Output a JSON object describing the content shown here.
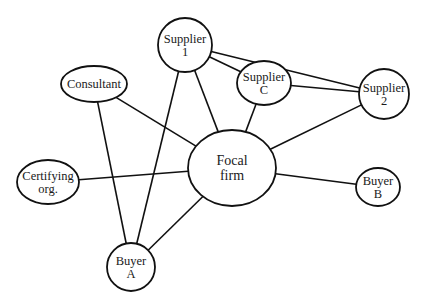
{
  "diagram": {
    "type": "network",
    "nodes": [
      {
        "id": "supplier1",
        "line1": "Supplier",
        "line2": "1",
        "shape": "circle",
        "cx": 185,
        "cy": 45,
        "rx": 27,
        "ry": 27
      },
      {
        "id": "consultant",
        "line1": "Consultant",
        "line2": "",
        "shape": "ellipse",
        "cx": 94,
        "cy": 84,
        "rx": 33,
        "ry": 18
      },
      {
        "id": "supplierC",
        "line1": "Supplier",
        "line2": "C",
        "shape": "ellipse",
        "cx": 264,
        "cy": 83,
        "rx": 27,
        "ry": 22
      },
      {
        "id": "supplier2",
        "line1": "Supplier",
        "line2": "2",
        "shape": "circle",
        "cx": 384,
        "cy": 94,
        "rx": 25,
        "ry": 25
      },
      {
        "id": "focal",
        "line1": "Focal",
        "line2": "firm",
        "shape": "ellipse",
        "cx": 232,
        "cy": 168,
        "rx": 44,
        "ry": 38
      },
      {
        "id": "certifying",
        "line1": "Certifying",
        "line2": "org.",
        "shape": "ellipse",
        "cx": 48,
        "cy": 182,
        "rx": 31,
        "ry": 22
      },
      {
        "id": "buyerB",
        "line1": "Buyer",
        "line2": "B",
        "shape": "ellipse",
        "cx": 378,
        "cy": 187,
        "rx": 22,
        "ry": 19
      },
      {
        "id": "buyerA",
        "line1": "Buyer",
        "line2": "A",
        "shape": "circle",
        "cx": 131,
        "cy": 267,
        "rx": 24,
        "ry": 24
      }
    ],
    "edges": [
      {
        "from": "supplier1",
        "to": "supplier2"
      },
      {
        "from": "supplier1",
        "to": "supplierC"
      },
      {
        "from": "supplier1",
        "to": "focal"
      },
      {
        "from": "supplier1",
        "to": "buyerA"
      },
      {
        "from": "supplierC",
        "to": "supplier2"
      },
      {
        "from": "supplierC",
        "to": "focal"
      },
      {
        "from": "supplier2",
        "to": "focal"
      },
      {
        "from": "consultant",
        "to": "focal"
      },
      {
        "from": "consultant",
        "to": "buyerA"
      },
      {
        "from": "certifying",
        "to": "focal"
      },
      {
        "from": "focal",
        "to": "buyerB"
      },
      {
        "from": "focal",
        "to": "buyerA"
      }
    ]
  }
}
